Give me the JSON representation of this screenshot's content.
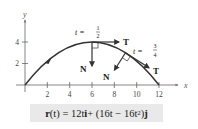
{
  "diagram": {
    "axes": {
      "x_label": "x",
      "y_label": "y",
      "x_ticks": [
        "2",
        "4",
        "6",
        "8",
        "10",
        "12"
      ],
      "y_ticks": [
        "2",
        "4"
      ]
    },
    "annotations": {
      "t_half": {
        "prefix": "t =",
        "num": "1",
        "den": "2"
      },
      "t_three_quarters": {
        "prefix": "t =",
        "num": "3",
        "den": "4"
      },
      "tangent_label_1": "T",
      "normal_label_1": "N",
      "tangent_label_2": "T",
      "normal_label_2": "N"
    },
    "formula": {
      "r": "r",
      "lhs_arg": "(t) = 12t",
      "i": "i",
      "plus": " + (16t − 16t",
      "exp": "2",
      "close": ")",
      "j": "j"
    },
    "colors": {
      "curve": "#333333",
      "axis": "#555555",
      "formula_bg": "#e9e9e9"
    }
  }
}
